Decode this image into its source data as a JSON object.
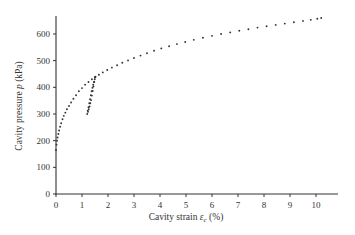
{
  "chart_data": {
    "type": "scatter",
    "title": "",
    "xlabel": "Cavity strain ε_c (%)",
    "xlabel_parts": {
      "prefix": "Cavity strain ",
      "symbol": "ε",
      "subscript": "c",
      "suffix": " (%)"
    },
    "ylabel": "Cavity pressure p (kPa)",
    "ylabel_parts": {
      "prefix": "Cavity pressure ",
      "symbol": "p",
      "suffix": " (kPa)"
    },
    "xlim": [
      0,
      10.5
    ],
    "ylim": [
      0,
      660
    ],
    "xticks": [
      0,
      1,
      2,
      3,
      4,
      5,
      6,
      7,
      8,
      9,
      10
    ],
    "yticks": [
      0,
      100,
      200,
      300,
      400,
      500,
      600
    ],
    "grid": false,
    "legend": "none",
    "series": [
      {
        "name": "loading",
        "x": [
          0.0,
          0.02,
          0.04,
          0.06,
          0.09,
          0.12,
          0.16,
          0.2,
          0.25,
          0.3,
          0.36,
          0.42,
          0.5,
          0.58,
          0.67,
          0.77,
          0.88,
          1.0,
          1.12,
          1.25,
          1.38,
          1.5,
          1.65,
          1.8,
          1.97,
          2.15,
          2.35,
          2.55,
          2.77,
          3.0,
          3.25,
          3.5,
          3.77,
          4.05,
          4.35,
          4.65,
          4.97,
          5.3,
          5.65,
          6.0,
          6.35,
          6.7,
          7.05,
          7.4,
          7.75,
          8.1,
          8.45,
          8.8,
          9.15,
          9.5,
          9.8,
          10.05,
          10.2
        ],
        "y": [
          165,
          185,
          200,
          212,
          225,
          238,
          252,
          265,
          280,
          293,
          305,
          318,
          330,
          343,
          357,
          370,
          385,
          397,
          410,
          420,
          430,
          438,
          447,
          456,
          465,
          474,
          483,
          492,
          501,
          510,
          519,
          528,
          537,
          546,
          554,
          562,
          570,
          578,
          586,
          593,
          600,
          606,
          612,
          618,
          624,
          629,
          634,
          639,
          644,
          649,
          653,
          657,
          660
        ]
      },
      {
        "name": "unload-reload loop",
        "x": [
          1.5,
          1.47,
          1.44,
          1.41,
          1.38,
          1.35,
          1.32,
          1.29,
          1.26,
          1.23,
          1.2,
          1.22,
          1.25,
          1.28,
          1.31,
          1.34,
          1.37,
          1.4,
          1.43,
          1.46,
          1.49,
          1.52
        ],
        "y": [
          438,
          420,
          403,
          386,
          369,
          352,
          340,
          328,
          318,
          308,
          300,
          312,
          325,
          340,
          355,
          370,
          385,
          398,
          410,
          420,
          430,
          440
        ]
      }
    ]
  }
}
